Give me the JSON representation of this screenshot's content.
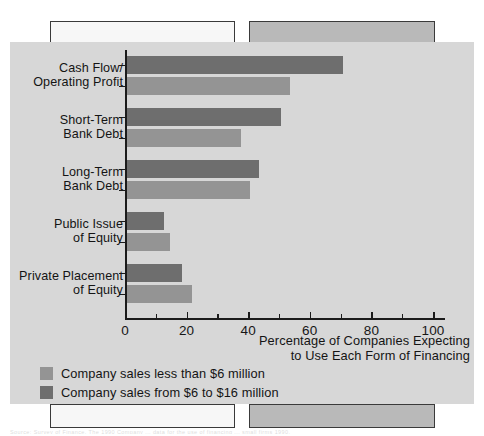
{
  "figure": {
    "background_color": "#d7d7d7",
    "page_background": "#ffffff"
  },
  "axis": {
    "x_title_line1": "Percentage of Companies Expecting",
    "x_title_line2": "to Use Each Form of Financing",
    "tick_labels": [
      "0",
      "20",
      "40",
      "60",
      "80",
      "100"
    ]
  },
  "legend": {
    "position": "bottom-left",
    "items": [
      {
        "label": "Company sales less than $6 million",
        "color": "#949494",
        "series": "small"
      },
      {
        "label": "Company sales from $6 to $16 million",
        "color": "#6e6e6e",
        "series": "large"
      }
    ]
  },
  "categories": [
    {
      "line1": "Cash Flow/",
      "line2": "Operating Profit"
    },
    {
      "line1": "Short-Term",
      "line2": "Bank Debt"
    },
    {
      "line1": "Long-Term",
      "line2": "Bank Debt"
    },
    {
      "line1": "Public Issue",
      "line2": "of Equity"
    },
    {
      "line1": "Private Placement",
      "line2": "of Equity"
    }
  ],
  "artifacts": {
    "bottom_caption": "Source: Survey of Finance. The 1990 Company ... data for the use of financing ... small firms 1990."
  },
  "chart_data": {
    "type": "bar",
    "orientation": "horizontal",
    "title": "",
    "subtitle": "",
    "xlabel": "Percentage of Companies Expecting to Use Each Form of Financing",
    "ylabel": "",
    "xlim": [
      0,
      100
    ],
    "xticks": [
      0,
      20,
      40,
      60,
      80,
      100
    ],
    "grid": false,
    "legend_position": "bottom-left",
    "categories": [
      "Cash Flow/Operating Profit",
      "Short-Term Bank Debt",
      "Long-Term Bank Debt",
      "Public Issue of Equity",
      "Private Placement of Equity"
    ],
    "series": [
      {
        "name": "Company sales from $6 to $16 million",
        "color": "#6e6e6e",
        "values": [
          70,
          50,
          43,
          12,
          18
        ]
      },
      {
        "name": "Company sales less than $6 million",
        "color": "#949494",
        "values": [
          53,
          37,
          40,
          14,
          21
        ]
      }
    ]
  }
}
